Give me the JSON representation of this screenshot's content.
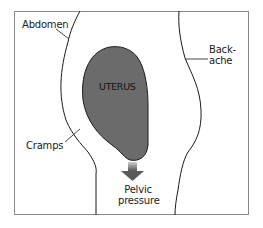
{
  "diagram": {
    "type": "anatomical-illustration",
    "organ_label": "UTERUS",
    "labels": [
      {
        "id": "abdomen",
        "text": "Abdomen"
      },
      {
        "id": "backache",
        "line1": "Back-",
        "line2": "ache"
      },
      {
        "id": "cramps",
        "text": "Cramps"
      },
      {
        "id": "pelvic-pressure",
        "line1": "Pelvic",
        "line2": "pressure"
      }
    ],
    "colors": {
      "uterus_fill": "#6b6b6b",
      "outline": "#1a1a1a",
      "frame": "#8a8a8a",
      "arrow_top": "#c8c8c8",
      "arrow_bottom": "#5a5a5a"
    }
  }
}
